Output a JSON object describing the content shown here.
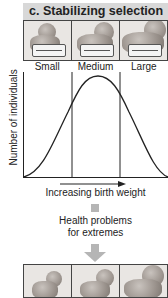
{
  "panel": {
    "title": "c. Stabilizing selection",
    "header_color": "#d8d8d8"
  },
  "top_row": {
    "photos": [
      {
        "label": "Small",
        "icon": "baby-photo-icon"
      },
      {
        "label": "Medium",
        "icon": "baby-photo-icon"
      },
      {
        "label": "Large",
        "icon": "baby-photo-icon"
      }
    ]
  },
  "graph": {
    "y_axis_label": "Number of individuals",
    "x_axis_label": "Increasing birth weight",
    "curve": "bell-shaped (normal) distribution peaking in the Medium category",
    "divisions": [
      "Small",
      "Medium",
      "Large"
    ]
  },
  "annotation": {
    "line1": "Health problems",
    "line2": "for extremes"
  },
  "bottom_row": {
    "photos": [
      {
        "icon": "baby-photo-icon"
      },
      {
        "icon": "baby-photo-icon"
      },
      {
        "icon": "baby-photo-icon"
      }
    ]
  },
  "colors": {
    "arrow": "#b5b5b5",
    "line": "#222222"
  }
}
